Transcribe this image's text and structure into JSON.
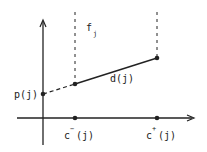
{
  "diagram": {
    "labels": {
      "p": "p(j)",
      "d": "d(j)",
      "f_base": "f",
      "f_sub": "j",
      "cminus_base": "c",
      "cminus_sup": "−",
      "cminus_arg": "(j)",
      "cplus_base": "c",
      "cplus_sup": "+",
      "cplus_arg": "(j)"
    },
    "colors": {
      "ink": "#222222",
      "background": "#ffffff"
    }
  }
}
